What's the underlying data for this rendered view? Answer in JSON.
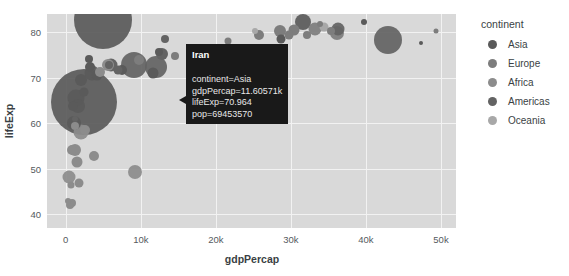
{
  "chart_data": {
    "type": "scatter",
    "title": "",
    "xlabel": "gdpPercap",
    "ylabel": "lifeExp",
    "xlim": [
      -2500,
      52000
    ],
    "ylim": [
      37,
      84
    ],
    "xticks": [
      "0",
      "10k",
      "20k",
      "30k",
      "40k",
      "50k"
    ],
    "xtickvals": [
      0,
      10000,
      20000,
      30000,
      40000,
      50000
    ],
    "yticks": [
      "40",
      "50",
      "60",
      "70",
      "80"
    ],
    "ytickvals": [
      40,
      50,
      60,
      70,
      80
    ],
    "grid": true,
    "size_encoding": "pop",
    "color_encoding": "continent",
    "legend_position": "right",
    "legend_title": "continent",
    "series": [
      {
        "name": "Asia",
        "color": "#5a5a5a"
      },
      {
        "name": "Europe",
        "color": "#7d7d7d"
      },
      {
        "name": "Africa",
        "color": "#8c8c8c"
      },
      {
        "name": "Americas",
        "color": "#636363"
      },
      {
        "name": "Oceania",
        "color": "#a8a8a8"
      }
    ],
    "points": [
      {
        "x": 4959,
        "y": 82.6,
        "r": 29,
        "c": "Asia"
      },
      {
        "x": 2452,
        "y": 64.7,
        "r": 33,
        "c": "Asia"
      },
      {
        "x": 3541,
        "y": 71.0,
        "r": 7.5,
        "c": "Asia"
      },
      {
        "x": 1391,
        "y": 65.5,
        "r": 8.5,
        "c": "Asia"
      },
      {
        "x": 1593,
        "y": 63.8,
        "r": 7.0,
        "c": "Asia"
      },
      {
        "x": 2013,
        "y": 69.5,
        "r": 6.0,
        "c": "Asia"
      },
      {
        "x": 4172,
        "y": 70.7,
        "r": 5.5,
        "c": "Asia"
      },
      {
        "x": 3190,
        "y": 72.4,
        "r": 5.0,
        "c": "Asia"
      },
      {
        "x": 2441,
        "y": 66.8,
        "r": 4.5,
        "c": "Asia"
      },
      {
        "x": 3095,
        "y": 74.1,
        "r": 4.0,
        "c": "Asia"
      },
      {
        "x": 6025,
        "y": 72.9,
        "r": 6.5,
        "c": "Asia"
      },
      {
        "x": 7458,
        "y": 71.8,
        "r": 5.0,
        "c": "Asia"
      },
      {
        "x": 11606,
        "y": 70.96,
        "r": 5.5,
        "c": "Asia"
      },
      {
        "x": 12452,
        "y": 75.6,
        "r": 4.0,
        "c": "Asia"
      },
      {
        "x": 31656,
        "y": 82.2,
        "r": 8.0,
        "c": "Asia"
      },
      {
        "x": 28718,
        "y": 78.6,
        "r": 4.5,
        "c": "Asia"
      },
      {
        "x": 39725,
        "y": 82.2,
        "r": 3.0,
        "c": "Asia"
      },
      {
        "x": 47307,
        "y": 77.6,
        "r": 2.0,
        "c": "Asia"
      },
      {
        "x": 1056,
        "y": 60.0,
        "r": 7.0,
        "c": "Asia"
      },
      {
        "x": 944,
        "y": 63.8,
        "r": 5.0,
        "c": "Asia"
      },
      {
        "x": 32170,
        "y": 79.4,
        "r": 4.0,
        "c": "Europe"
      },
      {
        "x": 36126,
        "y": 79.8,
        "r": 7.0,
        "c": "Europe"
      },
      {
        "x": 33207,
        "y": 80.7,
        "r": 6.5,
        "c": "Europe"
      },
      {
        "x": 30470,
        "y": 80.5,
        "r": 5.5,
        "c": "Europe"
      },
      {
        "x": 28569,
        "y": 80.2,
        "r": 6.0,
        "c": "Europe"
      },
      {
        "x": 25768,
        "y": 79.4,
        "r": 5.0,
        "c": "Europe"
      },
      {
        "x": 29796,
        "y": 79.3,
        "r": 4.5,
        "c": "Europe"
      },
      {
        "x": 35278,
        "y": 80.2,
        "r": 4.0,
        "c": "Europe"
      },
      {
        "x": 49357,
        "y": 80.2,
        "r": 2.5,
        "c": "Europe"
      },
      {
        "x": 33860,
        "y": 81.7,
        "r": 3.0,
        "c": "Europe"
      },
      {
        "x": 9786,
        "y": 74.0,
        "r": 5.0,
        "c": "Europe"
      },
      {
        "x": 14619,
        "y": 74.7,
        "r": 4.0,
        "c": "Europe"
      },
      {
        "x": 18008,
        "y": 76.4,
        "r": 3.5,
        "c": "Europe"
      },
      {
        "x": 21654,
        "y": 78.1,
        "r": 3.5,
        "c": "Europe"
      },
      {
        "x": 42951,
        "y": 78.2,
        "r": 14.0,
        "c": "Americas"
      },
      {
        "x": 36319,
        "y": 80.7,
        "r": 6.5,
        "c": "Americas"
      },
      {
        "x": 11977,
        "y": 72.4,
        "r": 11.0,
        "c": "Americas"
      },
      {
        "x": 9065,
        "y": 72.9,
        "r": 13.0,
        "c": "Americas"
      },
      {
        "x": 12779,
        "y": 75.3,
        "r": 6.0,
        "c": "Americas"
      },
      {
        "x": 13172,
        "y": 78.6,
        "r": 4.0,
        "c": "Americas"
      },
      {
        "x": 7007,
        "y": 71.8,
        "r": 4.5,
        "c": "Americas"
      },
      {
        "x": 5728,
        "y": 72.9,
        "r": 4.0,
        "c": "Americas"
      },
      {
        "x": 1201,
        "y": 60.9,
        "r": 3.0,
        "c": "Americas"
      },
      {
        "x": 1803,
        "y": 46.9,
        "r": 4.5,
        "c": "Africa"
      },
      {
        "x": 823,
        "y": 42.6,
        "r": 4.0,
        "c": "Africa"
      },
      {
        "x": 1271,
        "y": 54.1,
        "r": 6.0,
        "c": "Africa"
      },
      {
        "x": 430,
        "y": 48.3,
        "r": 6.5,
        "c": "Africa"
      },
      {
        "x": 2014,
        "y": 58.0,
        "r": 7.5,
        "c": "Africa"
      },
      {
        "x": 2603,
        "y": 58.6,
        "r": 5.0,
        "c": "Africa"
      },
      {
        "x": 1545,
        "y": 51.5,
        "r": 5.5,
        "c": "Africa"
      },
      {
        "x": 863,
        "y": 54.1,
        "r": 5.0,
        "c": "Africa"
      },
      {
        "x": 1217,
        "y": 59.4,
        "r": 4.0,
        "c": "Africa"
      },
      {
        "x": 5581,
        "y": 72.8,
        "r": 6.0,
        "c": "Africa"
      },
      {
        "x": 4513,
        "y": 71.3,
        "r": 5.0,
        "c": "Africa"
      },
      {
        "x": 9270,
        "y": 49.3,
        "r": 7.0,
        "c": "Africa"
      },
      {
        "x": 3820,
        "y": 52.9,
        "r": 5.0,
        "c": "Africa"
      },
      {
        "x": 619,
        "y": 42.1,
        "r": 4.0,
        "c": "Africa"
      },
      {
        "x": 706,
        "y": 46.4,
        "r": 3.5,
        "c": "Africa"
      },
      {
        "x": 277,
        "y": 43.0,
        "r": 3.0,
        "c": "Africa"
      },
      {
        "x": 34435,
        "y": 81.2,
        "r": 4.5,
        "c": "Oceania"
      },
      {
        "x": 25185,
        "y": 80.2,
        "r": 3.0,
        "c": "Oceania"
      }
    ]
  },
  "tooltip": {
    "title": "Iran",
    "rows": [
      "continent=Asia",
      "gdpPercap=11.60571k",
      "lifeExp=70.964",
      "pop=69453570"
    ]
  }
}
